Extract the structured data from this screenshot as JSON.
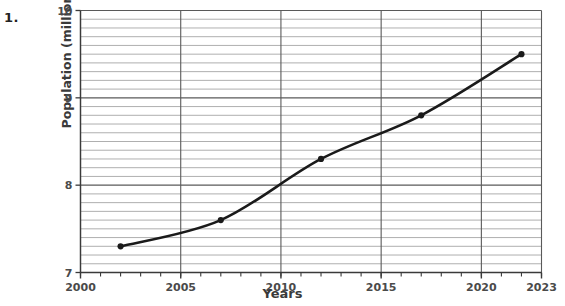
{
  "question_number": "1.",
  "chart_data": {
    "type": "line",
    "title": "",
    "xlabel": "Years",
    "ylabel": "Population (millions)",
    "xlim": [
      2000,
      2023
    ],
    "ylim": [
      7,
      10
    ],
    "x_ticks": [
      2000,
      2005,
      2010,
      2015,
      2020,
      2023
    ],
    "x_tick_labels": [
      "2000",
      "2005",
      "2010",
      "2015",
      "2020",
      "2023"
    ],
    "x_minor_tick_step": 1,
    "y_ticks": [
      7,
      8,
      9,
      10
    ],
    "y_tick_labels": [
      "7",
      "8",
      "9",
      "10"
    ],
    "y_minor_gridline_step": 0.1,
    "grid": true,
    "grid_major_color": "#5a5a5a",
    "grid_minor_color": "#9a9a9a",
    "legend": "none",
    "series": [
      {
        "name": "Population",
        "marker": "circle",
        "color": "#1a1a1a",
        "x": [
          2002,
          2007,
          2012,
          2017,
          2022
        ],
        "values": [
          7.3,
          7.6,
          8.3,
          8.8,
          9.5
        ]
      }
    ]
  }
}
